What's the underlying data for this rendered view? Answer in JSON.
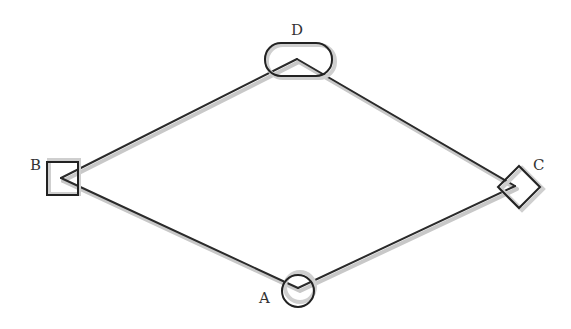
{
  "diagram": {
    "type": "graph",
    "nodes": [
      {
        "id": "A",
        "label": "A",
        "shape": "circle",
        "cx": 298,
        "cy": 290,
        "vertex": [
          298,
          288
        ],
        "label_pos": [
          260,
          302
        ]
      },
      {
        "id": "B",
        "label": "B",
        "shape": "square",
        "cx": 63,
        "cy": 178,
        "vertex": [
          61,
          178
        ],
        "label_pos": [
          30,
          169
        ]
      },
      {
        "id": "C",
        "label": "C",
        "shape": "diamond",
        "cx": 521,
        "cy": 188,
        "vertex": [
          515,
          186
        ],
        "label_pos": [
          533,
          169
        ]
      },
      {
        "id": "D",
        "label": "D",
        "shape": "rounded-rect",
        "cx": 297,
        "cy": 60,
        "vertex": [
          297,
          59
        ],
        "label_pos": [
          291,
          34
        ]
      }
    ],
    "edges": [
      {
        "from": "B",
        "to": "D"
      },
      {
        "from": "D",
        "to": "C"
      },
      {
        "from": "B",
        "to": "A"
      },
      {
        "from": "A",
        "to": "C"
      }
    ],
    "colors": {
      "line": "#2a2a2a",
      "shadow": "#c8c8c8",
      "label": "#333333",
      "background": "#ffffff"
    }
  }
}
